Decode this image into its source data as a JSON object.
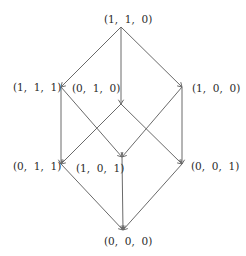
{
  "diagram": {
    "type": "lattice / Hasse diagram",
    "colors": {
      "line": "#6a6a6a",
      "text": "#2a2a2a",
      "background": "#ffffff"
    },
    "nodes": [
      {
        "id": "n110",
        "label": "(1,  1,  0)",
        "x": 121,
        "y": 27,
        "label_x": 104,
        "label_y": 13
      },
      {
        "id": "n111",
        "label": "(1,  1,  1)",
        "x": 61,
        "y": 87,
        "label_x": 13,
        "label_y": 81
      },
      {
        "id": "n010",
        "label": "(0,  1,  0)",
        "x": 121,
        "y": 104,
        "label_x": 72,
        "label_y": 82
      },
      {
        "id": "n100",
        "label": "(1,  0,  0)",
        "x": 182,
        "y": 87,
        "label_x": 192,
        "label_y": 82
      },
      {
        "id": "n011",
        "label": "(0,  1,  1)",
        "x": 61,
        "y": 164,
        "label_x": 13,
        "label_y": 160
      },
      {
        "id": "n101",
        "label": "(1,  0,  1)",
        "x": 122,
        "y": 157,
        "label_x": 76,
        "label_y": 162
      },
      {
        "id": "n001",
        "label": "(0,  0,  1)",
        "x": 182,
        "y": 164,
        "label_x": 191,
        "label_y": 160
      },
      {
        "id": "n000",
        "label": "(0,  0,  0)",
        "x": 123,
        "y": 230,
        "label_x": 104,
        "label_y": 235
      }
    ],
    "edges": [
      {
        "from": "n110",
        "to": "n111"
      },
      {
        "from": "n110",
        "to": "n010"
      },
      {
        "from": "n110",
        "to": "n100"
      },
      {
        "from": "n111",
        "to": "n011"
      },
      {
        "from": "n111",
        "to": "n101"
      },
      {
        "from": "n100",
        "to": "n101"
      },
      {
        "from": "n100",
        "to": "n001"
      },
      {
        "from": "n010",
        "to": "n011"
      },
      {
        "from": "n010",
        "to": "n001"
      },
      {
        "from": "n011",
        "to": "n000"
      },
      {
        "from": "n101",
        "to": "n000"
      },
      {
        "from": "n001",
        "to": "n000"
      }
    ]
  }
}
